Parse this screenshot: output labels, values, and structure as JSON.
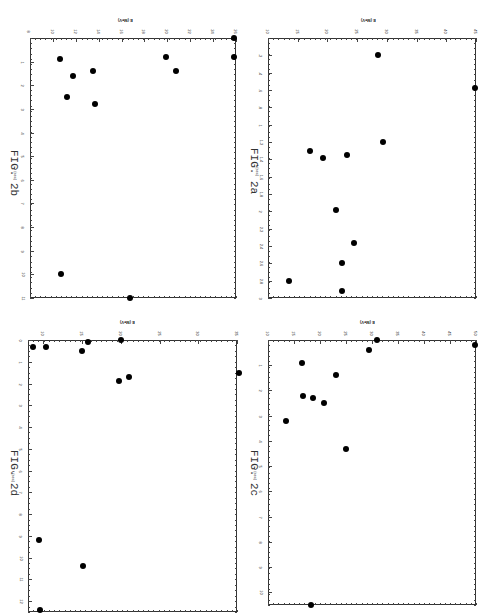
{
  "chart_data": [
    {
      "id": "2b",
      "type": "scatter",
      "title": "FIG. 2b",
      "xlabel": "t (sec)",
      "ylabel": "E (MeV)",
      "xlim": [
        0,
        11
      ],
      "ylim": [
        8,
        26
      ],
      "x_ticks": [
        "1",
        "2",
        "3",
        "4",
        "5",
        "6",
        "7",
        "8",
        "9",
        "10",
        "11"
      ],
      "y_ticks": [
        "8",
        "10",
        "12",
        "14",
        "16",
        "18",
        "20",
        "22",
        "24",
        "26"
      ],
      "points": [
        {
          "t": 0.0,
          "E": 25.8
        },
        {
          "t": 0.8,
          "E": 19.9
        },
        {
          "t": 0.8,
          "E": 25.8
        },
        {
          "t": 0.9,
          "E": 10.6
        },
        {
          "t": 1.4,
          "E": 13.5
        },
        {
          "t": 1.4,
          "E": 20.8
        },
        {
          "t": 1.6,
          "E": 11.8
        },
        {
          "t": 2.5,
          "E": 11.2
        },
        {
          "t": 2.8,
          "E": 13.7
        },
        {
          "t": 10.0,
          "E": 10.7
        },
        {
          "t": 11.0,
          "E": 16.7
        }
      ],
      "grid": false,
      "rotated": true
    },
    {
      "id": "2a",
      "type": "scatter",
      "title": "FIG. 2a",
      "xlabel": "t (sec)",
      "ylabel": "E (MeV)",
      "xlim": [
        0,
        3.0
      ],
      "ylim": [
        10,
        45
      ],
      "x_ticks": [
        ".2",
        ".4",
        ".6",
        ".8",
        "1",
        "1.2",
        "1.4",
        "1.6",
        "1.8",
        "2",
        "2.2",
        "2.4",
        "2.6",
        "2.8",
        "3"
      ],
      "y_ticks": [
        "10",
        "15",
        "20",
        "25",
        "30",
        "35",
        "40",
        "45"
      ],
      "points": [
        {
          "t": 0.2,
          "E": 28.5
        },
        {
          "t": 0.58,
          "E": 44.8
        },
        {
          "t": 1.2,
          "E": 29.3
        },
        {
          "t": 1.3,
          "E": 17.0
        },
        {
          "t": 1.38,
          "E": 19.2
        },
        {
          "t": 1.35,
          "E": 23.3
        },
        {
          "t": 1.98,
          "E": 21.5
        },
        {
          "t": 2.36,
          "E": 24.5
        },
        {
          "t": 2.6,
          "E": 22.5
        },
        {
          "t": 2.8,
          "E": 13.5
        },
        {
          "t": 2.92,
          "E": 22.5
        }
      ],
      "grid": false,
      "rotated": true
    },
    {
      "id": "2d",
      "type": "scatter",
      "title": "FIG. 2d",
      "xlabel": "t (sec)",
      "ylabel": "E (MeV)",
      "xlim": [
        0,
        12.5
      ],
      "ylim": [
        8,
        35
      ],
      "x_ticks": [
        "0",
        "1",
        "2",
        "3",
        "4",
        "5",
        "6",
        "7",
        "8",
        "9",
        "10",
        "11",
        "12"
      ],
      "y_ticks": [
        "10",
        "15",
        "20",
        "25",
        "30",
        "35"
      ],
      "points": [
        {
          "t": 0.0,
          "E": 20.0
        },
        {
          "t": 0.1,
          "E": 15.8
        },
        {
          "t": 0.3,
          "E": 8.7
        },
        {
          "t": 0.3,
          "E": 10.3
        },
        {
          "t": 0.5,
          "E": 15.0
        },
        {
          "t": 1.5,
          "E": 35.2
        },
        {
          "t": 1.7,
          "E": 21.0
        },
        {
          "t": 1.9,
          "E": 19.7
        },
        {
          "t": 9.2,
          "E": 9.4
        },
        {
          "t": 10.4,
          "E": 15.1
        },
        {
          "t": 12.4,
          "E": 9.6
        }
      ],
      "grid": false,
      "rotated": true
    },
    {
      "id": "2c",
      "type": "scatter",
      "title": "FIG. 2c",
      "xlabel": "t (sec)",
      "ylabel": "E (MeV)",
      "xlim": [
        0,
        10.5
      ],
      "ylim": [
        10,
        50
      ],
      "x_ticks": [
        "1",
        "2",
        "3",
        "4",
        "5",
        "6",
        "7",
        "8",
        "9",
        "10"
      ],
      "y_ticks": [
        "10",
        "15",
        "20",
        "25",
        "30",
        "35",
        "40",
        "45",
        "50"
      ],
      "points": [
        {
          "t": 0.0,
          "E": 31.0
        },
        {
          "t": 0.2,
          "E": 49.8
        },
        {
          "t": 0.4,
          "E": 29.5
        },
        {
          "t": 0.9,
          "E": 16.5
        },
        {
          "t": 1.4,
          "E": 23.0
        },
        {
          "t": 2.2,
          "E": 16.8
        },
        {
          "t": 2.3,
          "E": 18.6
        },
        {
          "t": 2.5,
          "E": 20.8
        },
        {
          "t": 3.2,
          "E": 13.5
        },
        {
          "t": 4.3,
          "E": 25.0
        },
        {
          "t": 10.5,
          "E": 18.3
        }
      ],
      "grid": false,
      "rotated": true
    }
  ],
  "panels": {
    "b": {
      "fig_label": "FIG. 2b",
      "e_title": "E (MeV)",
      "t_title": "t (sec)"
    },
    "a": {
      "fig_label": "FIG. 2a",
      "e_title": "E (MeV)",
      "t_title": "t (sec)"
    },
    "d": {
      "fig_label": "FIG. 2d",
      "e_title": "E (MeV)",
      "t_title": "t (sec)"
    },
    "c": {
      "fig_label": "FIG. 2c",
      "e_title": "E (MeV)",
      "t_title": "t (sec)"
    }
  }
}
